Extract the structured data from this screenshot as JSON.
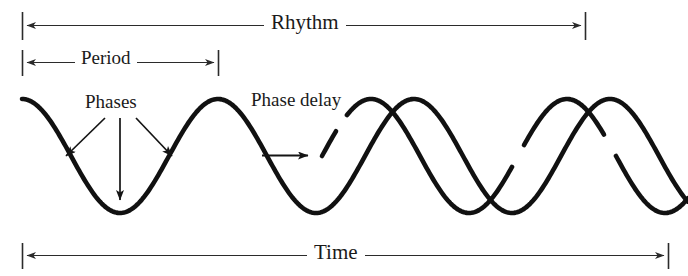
{
  "figure": {
    "background_color": "#ffffff",
    "stroke_color": "#111111",
    "annotation_color": "#1a1a1a"
  },
  "labels": {
    "rhythm": "Rhythm",
    "period": "Period",
    "time": "Time",
    "phases": "Phases",
    "phase_delay": "Phase delay"
  },
  "chart_data": {
    "type": "line",
    "title": "",
    "xlabel": "Time",
    "ylabel": "",
    "grid": false,
    "legend": "none",
    "xlim": [
      0,
      688
    ],
    "ylim": [
      0,
      276
    ],
    "annotations": [
      {
        "name": "rhythm",
        "label": "Rhythm",
        "kind": "dimension-arrow",
        "double_headed": true,
        "x_start": 22,
        "x_end": 585,
        "y": 25
      },
      {
        "name": "period",
        "label": "Period",
        "kind": "dimension-arrow",
        "double_headed": true,
        "x_start": 22,
        "x_end": 218,
        "y": 62
      },
      {
        "name": "time",
        "label": "Time",
        "kind": "dimension-arrow",
        "double_headed": true,
        "x_start": 22,
        "x_end": 668,
        "y": 255
      },
      {
        "name": "phases",
        "label": "Phases",
        "kind": "pointer-arrows",
        "label_x": 120,
        "label_y": 103,
        "targets": [
          {
            "x": 62,
            "y": 160
          },
          {
            "x": 120,
            "y": 205
          },
          {
            "x": 172,
            "y": 160
          }
        ]
      },
      {
        "name": "phase-delay",
        "label": "Phase delay",
        "kind": "pointer-arrow",
        "label_x": 300,
        "label_y": 101,
        "arrow_from_x": 262,
        "arrow_to_x": 312,
        "arrow_y": 155
      }
    ],
    "series": [
      {
        "name": "reference-wave",
        "description": "Continuous sinusoid used as the reference rhythm",
        "amplitude": 57,
        "baseline_y": 156,
        "period": 196,
        "phase_peak_x": 22,
        "x_start": 22,
        "x_end": 688
      },
      {
        "name": "delayed-wave",
        "description": "Second sinusoid shifted later in time by the phase delay",
        "amplitude": 57,
        "baseline_y": 156,
        "period": 196,
        "phase_peak_x": 371,
        "x_start": 322,
        "x_end": 688,
        "breaks": [
          {
            "x_from": 336,
            "x_to": 347
          },
          {
            "x_from": 512,
            "x_to": 524
          },
          {
            "x_from": 604,
            "x_to": 616
          }
        ]
      }
    ]
  }
}
